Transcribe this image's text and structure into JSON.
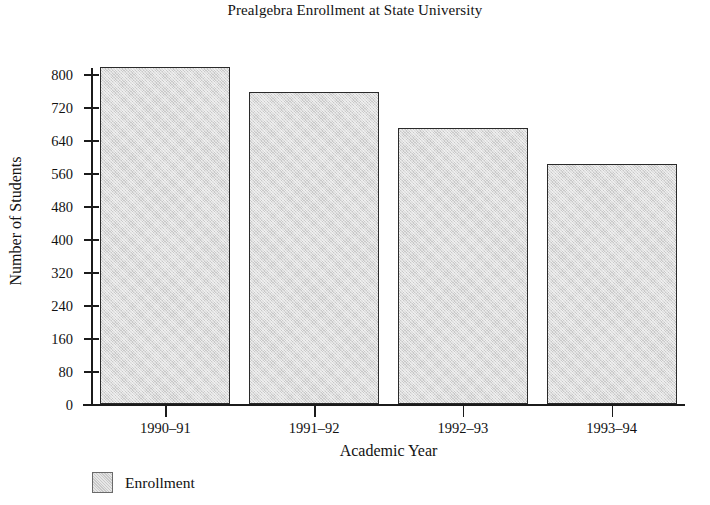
{
  "chart_data": {
    "type": "bar",
    "title": "Prealgebra Enrollment at State University",
    "xlabel": "Academic Year",
    "ylabel": "Number of Students",
    "categories": [
      "1990–91",
      "1991–92",
      "1992–93",
      "1993–94"
    ],
    "series": [
      {
        "name": "Enrollment",
        "values": [
          817,
          758,
          669,
          582
        ],
        "color": "#c9c9c9"
      }
    ],
    "ylim": [
      0,
      840
    ],
    "ytick_labels": [
      "0",
      "80",
      "160",
      "240",
      "320",
      "400",
      "480",
      "560",
      "640",
      "720",
      "800"
    ],
    "ytick_values": [
      0,
      80,
      160,
      240,
      320,
      400,
      480,
      560,
      640,
      720,
      800
    ],
    "grid": false,
    "legend": {
      "position": "bottom-left",
      "entries": [
        {
          "label": "Enrollment",
          "color": "#c9c9c9"
        }
      ]
    },
    "axis_color": "#1b1b1b",
    "background": "#ffffff"
  }
}
